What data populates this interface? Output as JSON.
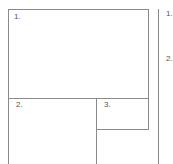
{
  "diagram": {
    "panels": [
      {
        "id": "panel-1",
        "label": "1."
      },
      {
        "id": "panel-2",
        "label": "2."
      },
      {
        "id": "panel-3",
        "label": "3."
      }
    ],
    "side_column": {
      "labels": [
        "1.",
        "2."
      ]
    },
    "line_color": "#8a8a8a",
    "text_color": "#555555"
  }
}
